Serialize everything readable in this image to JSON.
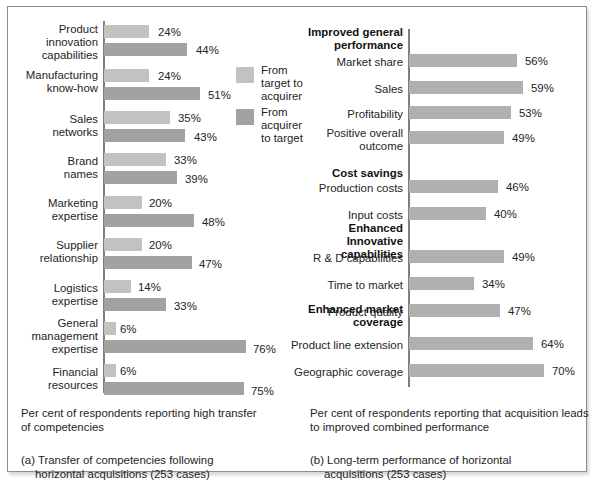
{
  "legend": {
    "items": [
      {
        "label": "From\ntarget to\nacquirer",
        "color": "#c2c2c2",
        "name": "from-target-to-acquirer"
      },
      {
        "label": "From\nacquirer\nto target",
        "color": "#a2a2a2",
        "name": "from-acquirer-to-target"
      }
    ]
  },
  "panel_a": {
    "note": "Per cent of respondents reporting high transfer\nof competencies",
    "title_prefix": "(a) Transfer of competencies following",
    "title_rest": "horizontal acquisitions (253 cases)"
  },
  "panel_b": {
    "note": "Per cent of respondents reporting that acquisition leads\nto improved combined performance",
    "title_prefix": "(b) Long-term performance of horizontal",
    "title_rest": "acquisitions (253 cases)"
  },
  "chart_data": [
    {
      "type": "bar",
      "id": "panel-a",
      "title": "(a) Transfer of competencies following horizontal acquisitions (253 cases)",
      "xlabel": "Per cent of respondents reporting high transfer of competencies",
      "ylabel": "",
      "orientation": "horizontal",
      "grid": false,
      "xlim": [
        0,
        80
      ],
      "legend_position": "center-right",
      "categories": [
        "Product\ninnovation\ncapabilities",
        "Manufacturing\nknow-how",
        "Sales\nnetworks",
        "Brand\nnames",
        "Marketing\nexpertise",
        "Supplier\nrelationship",
        "Logistics\nexpertise",
        "General\nmanagement\nexpertise",
        "Financial\nresources"
      ],
      "series": [
        {
          "name": "From target to acquirer",
          "color": "#c2c2c2",
          "values": [
            24,
            24,
            35,
            33,
            20,
            20,
            14,
            6,
            6
          ],
          "labels": [
            "24%",
            "24%",
            "35%",
            "33%",
            "20%",
            "20%",
            "14%",
            "6%",
            "6%"
          ]
        },
        {
          "name": "From acquirer to target",
          "color": "#a2a2a2",
          "values": [
            44,
            51,
            43,
            39,
            48,
            47,
            33,
            76,
            75
          ],
          "labels": [
            "44%",
            "51%",
            "43%",
            "39%",
            "48%",
            "47%",
            "33%",
            "76%",
            "75%"
          ]
        }
      ]
    },
    {
      "type": "bar",
      "id": "panel-b",
      "title": "(b) Long-term performance of horizontal acquisitions (253 cases)",
      "xlabel": "Per cent of respondents reporting that acquisition leads to improved combined performance",
      "ylabel": "",
      "orientation": "horizontal",
      "grid": false,
      "xlim": [
        0,
        80
      ],
      "groups": [
        {
          "heading": "Improved general\nperformance",
          "categories": [
            "Market share",
            "Sales",
            "Profitability",
            "Positive overall\noutcome"
          ],
          "values": [
            56,
            59,
            53,
            49
          ],
          "labels": [
            "56%",
            "59%",
            "53%",
            "49%"
          ]
        },
        {
          "heading": "Cost savings",
          "categories": [
            "Production costs",
            "Input costs"
          ],
          "values": [
            46,
            40
          ],
          "labels": [
            "46%",
            "40%"
          ]
        },
        {
          "heading": "Enhanced Innovative\ncapabilities",
          "categories": [
            "R & D capabilities",
            "Time to market",
            "Product quality"
          ],
          "values": [
            49,
            34,
            47
          ],
          "labels": [
            "49%",
            "34%",
            "47%"
          ]
        },
        {
          "heading": "Enhanced market\ncoverage",
          "categories": [
            "Product line extension",
            "Geographic coverage"
          ],
          "values": [
            64,
            70
          ],
          "labels": [
            "64%",
            "70%"
          ]
        }
      ],
      "series": [
        {
          "name": "combined performance",
          "color": "#b0b0b0"
        }
      ]
    }
  ],
  "layout_a": {
    "rows": [
      {
        "cat_top": 16,
        "cat_left": 2,
        "cat_w": 88,
        "b1_top": 18,
        "b1_w": 45,
        "v1_left": 150,
        "v1_top": 19,
        "b2_top": 36,
        "b2_w": 83,
        "v2_left": 188,
        "v2_top": 37
      },
      {
        "cat_top": 62,
        "cat_left": 2,
        "cat_w": 88,
        "b1_top": 62,
        "b1_w": 45,
        "v1_left": 150,
        "v1_top": 63,
        "b2_top": 80,
        "b2_w": 96,
        "v2_left": 200,
        "v2_top": 82
      },
      {
        "cat_top": 106,
        "cat_left": 2,
        "cat_w": 88,
        "b1_top": 104,
        "b1_w": 66,
        "v1_left": 170,
        "v1_top": 105,
        "b2_top": 122,
        "b2_w": 81,
        "v2_left": 186,
        "v2_top": 124
      },
      {
        "cat_top": 148,
        "cat_left": 2,
        "cat_w": 88,
        "b1_top": 146,
        "b1_w": 62,
        "v1_left": 166,
        "v1_top": 147,
        "b2_top": 164,
        "b2_w": 73,
        "v2_left": 177,
        "v2_top": 166
      },
      {
        "cat_top": 190,
        "cat_left": 2,
        "cat_w": 88,
        "b1_top": 189,
        "b1_w": 38,
        "v1_left": 141,
        "v1_top": 190,
        "b2_top": 207,
        "b2_w": 90,
        "v2_left": 194,
        "v2_top": 209
      },
      {
        "cat_top": 232,
        "cat_left": 2,
        "cat_w": 88,
        "b1_top": 231,
        "b1_w": 38,
        "v1_left": 141,
        "v1_top": 232,
        "b2_top": 249,
        "b2_w": 88,
        "v2_left": 191,
        "v2_top": 251
      },
      {
        "cat_top": 275,
        "cat_left": 2,
        "cat_w": 88,
        "b1_top": 273,
        "b1_w": 27,
        "v1_left": 130,
        "v1_top": 274,
        "b2_top": 291,
        "b2_w": 62,
        "v2_left": 166,
        "v2_top": 293
      },
      {
        "cat_top": 310,
        "cat_left": 2,
        "cat_w": 88,
        "b1_top": 315,
        "b1_w": 12,
        "v1_left": 112,
        "v1_top": 316,
        "b2_top": 333,
        "b2_w": 142,
        "v2_left": 245,
        "v2_top": 336
      },
      {
        "cat_top": 359,
        "cat_left": 2,
        "cat_w": 88,
        "b1_top": 357,
        "b1_w": 12,
        "v1_left": 112,
        "v1_top": 358,
        "b2_top": 375,
        "b2_w": 140,
        "v2_left": 243,
        "v2_top": 378
      }
    ]
  },
  "layout_b": {
    "headings": [
      {
        "top": 19,
        "left": 0,
        "w": 107
      },
      {
        "top": 160,
        "left": 0,
        "w": 107
      },
      {
        "top": 215,
        "left": 0,
        "w": 107
      },
      {
        "top": 296,
        "left": 0,
        "w": 107
      }
    ],
    "rows": [
      {
        "cat_top": 49,
        "cat_left": 0,
        "cat_w": 107,
        "b_top": 47,
        "b_w": 108,
        "v_left": 124,
        "v_top": 48
      },
      {
        "cat_top": 76,
        "cat_left": 0,
        "cat_w": 107,
        "b_top": 74,
        "b_w": 114,
        "v_left": 130,
        "v_top": 75
      },
      {
        "cat_top": 101,
        "cat_left": 0,
        "cat_w": 107,
        "b_top": 99,
        "b_w": 102,
        "v_left": 118,
        "v_top": 100
      },
      {
        "cat_top": 120,
        "cat_left": 0,
        "cat_w": 107,
        "b_top": 124,
        "b_w": 95,
        "v_left": 111,
        "v_top": 125
      },
      {
        "cat_top": 175,
        "cat_left": 0,
        "cat_w": 107,
        "b_top": 173,
        "b_w": 89,
        "v_left": 105,
        "v_top": 174
      },
      {
        "cat_top": 202,
        "cat_left": 0,
        "cat_w": 107,
        "b_top": 200,
        "b_w": 77,
        "v_left": 93,
        "v_top": 201
      },
      {
        "cat_top": 245,
        "cat_left": 0,
        "cat_w": 107,
        "b_top": 243,
        "b_w": 95,
        "v_left": 111,
        "v_top": 244
      },
      {
        "cat_top": 272,
        "cat_left": 0,
        "cat_w": 107,
        "b_top": 270,
        "b_w": 65,
        "v_left": 81,
        "v_top": 271
      },
      {
        "cat_top": 299,
        "cat_left": 0,
        "cat_w": 107,
        "b_top": 297,
        "b_w": 91,
        "v_left": 107,
        "v_top": 298
      },
      {
        "cat_top": 332,
        "cat_left": -12,
        "cat_w": 119,
        "b_top": 330,
        "b_w": 124,
        "v_left": 140,
        "v_top": 331
      },
      {
        "cat_top": 359,
        "cat_left": -8,
        "cat_w": 115,
        "b_top": 357,
        "b_w": 135,
        "v_left": 151,
        "v_top": 358
      }
    ]
  }
}
